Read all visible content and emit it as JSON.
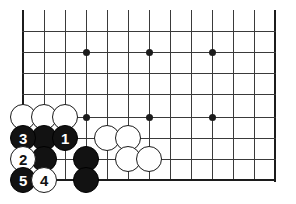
{
  "diagram": {
    "type": "go-board-diagram",
    "board": {
      "width_px": 296,
      "height_px": 204,
      "background_color": "#ffffff",
      "line_color": "#3a3a3a",
      "edge_line_color": "#1c1c1c",
      "cell_size_px": 21,
      "columns_x": [
        23,
        44,
        65,
        86,
        107,
        128,
        149,
        170,
        191,
        212,
        233,
        254,
        275
      ],
      "rows_y": [
        10,
        31,
        52,
        73,
        94,
        117,
        138,
        159,
        180
      ],
      "left_edge_x": 23,
      "right_edge_x": 275,
      "bottom_edge_y": 180,
      "star_points": [
        {
          "x": 86,
          "y": 52
        },
        {
          "x": 149,
          "y": 52
        },
        {
          "x": 212,
          "y": 52
        },
        {
          "x": 86,
          "y": 117
        },
        {
          "x": 149,
          "y": 117
        },
        {
          "x": 212,
          "y": 117
        }
      ]
    },
    "stones": [
      {
        "id": "white-a1",
        "color": "white",
        "x": 23,
        "y": 117,
        "label": ""
      },
      {
        "id": "white-b1",
        "color": "white",
        "x": 44,
        "y": 117,
        "label": ""
      },
      {
        "id": "white-c1",
        "color": "white",
        "x": 65,
        "y": 117,
        "label": ""
      },
      {
        "id": "black-move-3",
        "color": "black",
        "x": 23,
        "y": 138,
        "label": "3"
      },
      {
        "id": "black-b2",
        "color": "black",
        "x": 44,
        "y": 138,
        "label": ""
      },
      {
        "id": "black-move-1",
        "color": "black",
        "x": 65,
        "y": 138,
        "label": "1"
      },
      {
        "id": "white-e2",
        "color": "white",
        "x": 107,
        "y": 138,
        "label": ""
      },
      {
        "id": "white-f2",
        "color": "white",
        "x": 128,
        "y": 138,
        "label": ""
      },
      {
        "id": "white-move-2",
        "color": "white",
        "x": 23,
        "y": 159,
        "label": "2"
      },
      {
        "id": "black-b3",
        "color": "black",
        "x": 44,
        "y": 159,
        "label": ""
      },
      {
        "id": "black-d3",
        "color": "black",
        "x": 86,
        "y": 159,
        "label": ""
      },
      {
        "id": "white-f3",
        "color": "white",
        "x": 128,
        "y": 159,
        "label": ""
      },
      {
        "id": "white-g3",
        "color": "white",
        "x": 149,
        "y": 159,
        "label": ""
      },
      {
        "id": "black-move-5",
        "color": "black",
        "x": 23,
        "y": 180,
        "label": "5"
      },
      {
        "id": "white-move-4",
        "color": "white",
        "x": 44,
        "y": 180,
        "label": "4"
      },
      {
        "id": "black-d4",
        "color": "black",
        "x": 86,
        "y": 180,
        "label": ""
      }
    ],
    "move_sequence": [
      {
        "number": "1",
        "color": "black"
      },
      {
        "number": "2",
        "color": "white"
      },
      {
        "number": "3",
        "color": "black"
      },
      {
        "number": "4",
        "color": "white"
      },
      {
        "number": "5",
        "color": "black"
      }
    ]
  }
}
